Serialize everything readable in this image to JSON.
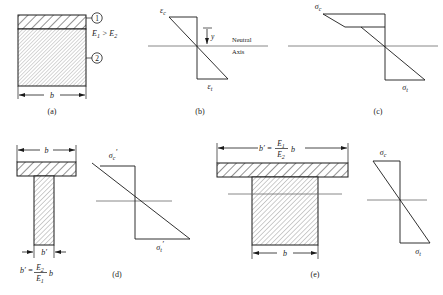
{
  "figure": {
    "panels": [
      {
        "id": "a",
        "caption": "(a)",
        "type": "cross-section",
        "description": "Two-material rectangular cross section of width b, material 1 on top (thin), material 2 below (thick)",
        "labels": {
          "material_1_tag": "1",
          "material_2_tag": "2",
          "modulus_relation": "E",
          "modulus_relation_sub1": "1",
          "modulus_relation_op": " > E",
          "modulus_relation_sub2": "2",
          "width_dim": "b"
        }
      },
      {
        "id": "b",
        "caption": "(b)",
        "type": "strain-distribution",
        "description": "Linear strain distribution through depth, continuous across the neutral axis",
        "labels": {
          "top_label": "ε",
          "top_sub": "c",
          "bottom_label": "ε",
          "bottom_sub": "t",
          "neutral_axis_line1": "Neutral",
          "neutral_axis_line2": "Axis",
          "distance_label": "y"
        }
      },
      {
        "id": "c",
        "caption": "(c)",
        "type": "stress-distribution",
        "description": "Stress distribution with a step discontinuity at the material interface due to differing moduli",
        "labels": {
          "top_label": "σ",
          "top_sub": "c",
          "bottom_label": "σ",
          "bottom_sub": "t"
        }
      },
      {
        "id": "d",
        "caption": "(d)",
        "type": "transformed-section",
        "description": "Transformed T-section with narrowed web of width b-prime, and its linear stress distribution",
        "labels": {
          "width_dim": "b",
          "web_width_dim": "b′",
          "formula_lhs": "b′",
          "formula_eq": " = ",
          "formula_num": "E",
          "formula_num_sub": "2",
          "formula_den": "E",
          "formula_den_sub": "1",
          "formula_tail": "b",
          "stress_top": "σ",
          "stress_top_sub": "c",
          "stress_top_prime": "′",
          "stress_bottom": "σ",
          "stress_bottom_sub": "t",
          "stress_bottom_prime": "′"
        }
      },
      {
        "id": "e",
        "caption": "(e)",
        "type": "transformed-section",
        "description": "Transformed T-section with widened flange of width b-prime, and its linear stress distribution",
        "labels": {
          "width_dim": "b",
          "flange_width_dim": "b′",
          "formula_lhs": "b′",
          "formula_eq": " = ",
          "formula_num": "E",
          "formula_num_sub": "1",
          "formula_den": "E",
          "formula_den_sub": "2",
          "formula_tail": "b",
          "stress_top": "σ",
          "stress_top_sub": "c",
          "stress_bottom": "σ",
          "stress_bottom_sub": "t"
        }
      }
    ],
    "colors": {
      "ink": "#1a1a1a",
      "axis_gray": "#6b6b6b",
      "hatch": "#4d4d4d",
      "fill": "#ffffff",
      "background": "#ffffff"
    }
  }
}
